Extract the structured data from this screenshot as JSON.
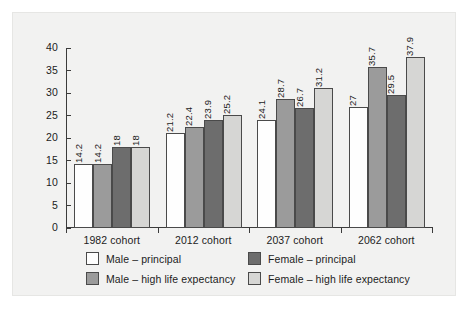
{
  "chart_data": {
    "type": "bar",
    "title": "",
    "subtitle": "",
    "xlabel": "",
    "ylabel": "",
    "ylim": [
      0,
      40
    ],
    "yticks": [
      0,
      5,
      10,
      15,
      20,
      25,
      30,
      35,
      40
    ],
    "ytick_labels": [
      "0",
      "5",
      "10",
      "15",
      "20",
      "25",
      "30",
      "35",
      "40"
    ],
    "grid": false,
    "legend_position": "bottom",
    "categories": [
      "1982 cohort",
      "2012 cohort",
      "2037 cohort",
      "2062 cohort"
    ],
    "series": [
      {
        "name": "Male – principal",
        "color": "#fefefe",
        "values": [
          14.2,
          21.2,
          24.1,
          27
        ],
        "labels": [
          "14.2",
          "21.2",
          "24.1",
          "27"
        ]
      },
      {
        "name": "Male – high life expectancy",
        "color": "#9b9b9b",
        "values": [
          14.2,
          22.4,
          28.7,
          35.7
        ],
        "labels": [
          "14.2",
          "22.4",
          "28.7",
          "35.7"
        ]
      },
      {
        "name": "Female – principal",
        "color": "#6d6d6d",
        "values": [
          18,
          23.9,
          26.7,
          29.5
        ],
        "labels": [
          "18",
          "23.9",
          "26.7",
          "29.5"
        ]
      },
      {
        "name": "Female – high life expectancy",
        "color": "#d6d6d4",
        "values": [
          18,
          25.2,
          31.2,
          37.9
        ],
        "labels": [
          "18",
          "25.2",
          "31.2",
          "37.9"
        ]
      }
    ]
  },
  "legend": {
    "items": [
      {
        "label": "Male – principal",
        "swatch": "c-white"
      },
      {
        "label": "Female – principal",
        "swatch": "c-dark"
      },
      {
        "label": "Male – high life expectancy",
        "swatch": "c-mid"
      },
      {
        "label": "Female – high life expectancy",
        "swatch": "c-light"
      }
    ]
  },
  "axis": {
    "y_tick_labels": [
      "40",
      "35",
      "30",
      "25",
      "20",
      "15",
      "10",
      "5",
      "0"
    ]
  },
  "colors": {
    "panel_background": "#f2f2f1",
    "axis": "#3b3b3b",
    "text": "#1c1c1c",
    "bar_white": "#fefefe",
    "bar_mid_gray": "#9b9b9b",
    "bar_dark_gray": "#6d6d6d",
    "bar_light_gray": "#d6d6d4"
  }
}
